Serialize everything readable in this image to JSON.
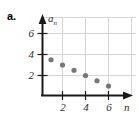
{
  "part": {
    "label": "a."
  },
  "chart_data": {
    "type": "scatter",
    "title": "",
    "xlabel": "n",
    "ylabel": "a",
    "ylabel_sub": "n",
    "x": [
      1,
      2,
      3,
      4,
      5,
      6
    ],
    "values": [
      3.5,
      3.0,
      2.5,
      2.0,
      1.5,
      1.0
    ],
    "points": [
      {
        "n": 1,
        "a": 3.5
      },
      {
        "n": 2,
        "a": 3.0
      },
      {
        "n": 3,
        "a": 2.5
      },
      {
        "n": 4,
        "a": 2.0
      },
      {
        "n": 5,
        "a": 1.5
      },
      {
        "n": 6,
        "a": 1.0
      }
    ],
    "xlim": [
      0,
      7.2
    ],
    "ylim": [
      0,
      7.4
    ],
    "xticks": [
      2,
      4,
      6
    ],
    "xtick_labels": [
      "2",
      "4",
      "6"
    ],
    "yticks": [
      2,
      4,
      6
    ],
    "ytick_labels": [
      "2",
      "4",
      "6"
    ],
    "grid": true,
    "grid_x": [
      2,
      4,
      6
    ],
    "grid_y": [
      2,
      4,
      6
    ],
    "legend": null,
    "marker_color": "#777777",
    "axis_color": "#1a1a1a",
    "grid_color": "#d5d5d5"
  }
}
